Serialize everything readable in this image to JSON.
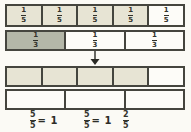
{
  "figure": {
    "colors": {
      "light_shade": "#e7e4d4",
      "dark_shade": "#b4b7a8",
      "border": "#45453e",
      "background": "#fbfaf5",
      "text": "#33332c"
    }
  },
  "bar_fifths": {
    "cells": [
      {
        "numerator": "1",
        "denominator": "5",
        "shaded": true
      },
      {
        "numerator": "1",
        "denominator": "5",
        "shaded": true
      },
      {
        "numerator": "1",
        "denominator": "5",
        "shaded": true
      },
      {
        "numerator": "1",
        "denominator": "5",
        "shaded": true
      },
      {
        "numerator": "1",
        "denominator": "5",
        "shaded": false
      }
    ]
  },
  "bar_thirds": {
    "cells": [
      {
        "numerator": "1",
        "denominator": "3",
        "shaded": true
      },
      {
        "numerator": "1",
        "denominator": "3",
        "shaded": false
      },
      {
        "numerator": "1",
        "denominator": "3",
        "shaded": false
      }
    ]
  },
  "bar_fifteenths_light": {
    "big_cells": 5,
    "subdivisions_per_cell": 3,
    "shaded_big_cells": 4,
    "total_parts": 15,
    "shaded_parts": 12
  },
  "bar_fifteenths_dark": {
    "big_cells": 3,
    "subdivisions_per_cell": 5,
    "total_parts": 15,
    "shaded_parts": 12
  },
  "result_labels": [
    {
      "numerator": "5",
      "denominator": "5",
      "suffix": "= 1"
    },
    {
      "numerator": "5",
      "denominator": "5",
      "suffix": "= 1"
    },
    {
      "numerator": "2",
      "denominator": "5",
      "suffix": ""
    }
  ]
}
